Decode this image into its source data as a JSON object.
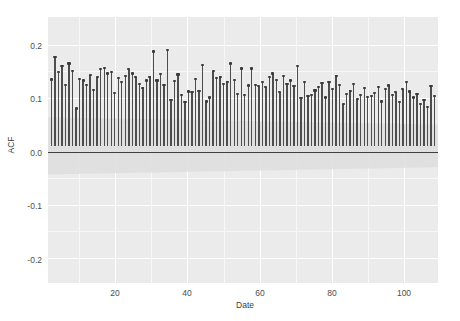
{
  "chart_data": {
    "type": "bar",
    "title": "",
    "xlabel": "Date",
    "ylabel": "ACF",
    "xlim": [
      0,
      111
    ],
    "ylim": [
      -0.25,
      0.235
    ],
    "grid": true,
    "legend": null,
    "xticks": [
      20,
      40,
      60,
      80,
      100
    ],
    "xtick_labels": [
      "20",
      "40",
      "60",
      "80",
      "100"
    ],
    "yticks": [
      -0.2,
      -0.1,
      0.0,
      0.1,
      0.2
    ],
    "ytick_labels": [
      "-0.2",
      "-0.1",
      "0.0",
      "0.1",
      "0.2"
    ],
    "zero_line": 0.0,
    "confidence_band": {
      "description": "significance band, shaded, narrows slightly with lag",
      "start_value": 0.052,
      "end_value": 0.039
    },
    "bar_color": "#4d4d4d",
    "panel_color": "#ebebeb",
    "grid_color": "#ffffff",
    "x": [
      1,
      2,
      3,
      4,
      5,
      6,
      7,
      8,
      9,
      10,
      11,
      12,
      13,
      14,
      15,
      16,
      17,
      18,
      19,
      20,
      21,
      22,
      23,
      24,
      25,
      26,
      27,
      28,
      29,
      30,
      31,
      32,
      33,
      34,
      35,
      36,
      37,
      38,
      39,
      40,
      41,
      42,
      43,
      44,
      45,
      46,
      47,
      48,
      49,
      50,
      51,
      52,
      53,
      54,
      55,
      56,
      57,
      58,
      59,
      60,
      61,
      62,
      63,
      64,
      65,
      66,
      67,
      68,
      69,
      70,
      71,
      72,
      73,
      74,
      75,
      76,
      77,
      78,
      79,
      80,
      81,
      82,
      83,
      84,
      85,
      86,
      87,
      88,
      89,
      90,
      91,
      92,
      93,
      94,
      95,
      96,
      97,
      98,
      99,
      100,
      101,
      102,
      103,
      104,
      105,
      106,
      107,
      108,
      109,
      110
    ],
    "categories": [
      "1",
      "2",
      "3",
      "4",
      "5",
      "6",
      "7",
      "8",
      "9",
      "10",
      "11",
      "12",
      "13",
      "14",
      "15",
      "16",
      "17",
      "18",
      "19",
      "20",
      "21",
      "22",
      "23",
      "24",
      "25",
      "26",
      "27",
      "28",
      "29",
      "30",
      "31",
      "32",
      "33",
      "34",
      "35",
      "36",
      "37",
      "38",
      "39",
      "40",
      "41",
      "42",
      "43",
      "44",
      "45",
      "46",
      "47",
      "48",
      "49",
      "50",
      "51",
      "52",
      "53",
      "54",
      "55",
      "56",
      "57",
      "58",
      "59",
      "60",
      "61",
      "62",
      "63",
      "64",
      "65",
      "66",
      "67",
      "68",
      "69",
      "70",
      "71",
      "72",
      "73",
      "74",
      "75",
      "76",
      "77",
      "78",
      "79",
      "80",
      "81",
      "82",
      "83",
      "84",
      "85",
      "86",
      "87",
      "88",
      "89",
      "90",
      "91",
      "92",
      "93",
      "94",
      "95",
      "96",
      "97",
      "98",
      "99",
      "100",
      "101",
      "102",
      "103",
      "104",
      "105",
      "106",
      "107",
      "108",
      "109",
      "110"
    ],
    "values": [
      0.122,
      0.163,
      0.135,
      0.146,
      0.112,
      0.151,
      0.138,
      0.069,
      0.123,
      0.12,
      0.112,
      0.13,
      0.103,
      0.126,
      0.141,
      0.143,
      0.133,
      0.136,
      0.098,
      0.125,
      0.118,
      0.129,
      0.141,
      0.133,
      0.126,
      0.114,
      0.107,
      0.12,
      0.127,
      0.173,
      0.12,
      0.132,
      0.112,
      0.175,
      0.085,
      0.119,
      0.131,
      0.093,
      0.081,
      0.1,
      0.099,
      0.123,
      0.101,
      0.148,
      0.082,
      0.089,
      0.137,
      0.124,
      0.127,
      0.114,
      0.118,
      0.151,
      0.121,
      0.095,
      0.142,
      0.094,
      0.111,
      0.142,
      0.112,
      0.11,
      0.118,
      0.108,
      0.126,
      0.133,
      0.121,
      0.099,
      0.129,
      0.114,
      0.12,
      0.11,
      0.147,
      0.088,
      0.117,
      0.092,
      0.094,
      0.102,
      0.108,
      0.116,
      0.089,
      0.118,
      0.104,
      0.129,
      0.112,
      0.077,
      0.096,
      0.101,
      0.113,
      0.086,
      0.094,
      0.106,
      0.09,
      0.092,
      0.098,
      0.108,
      0.082,
      0.104,
      0.111,
      0.093,
      0.099,
      0.081,
      0.104,
      0.118,
      0.1,
      0.089,
      0.096,
      0.078,
      0.084,
      0.072,
      0.11,
      0.092
    ],
    "series": [
      {
        "name": "ACF",
        "values": [
          0.122,
          0.163,
          0.135,
          0.146,
          0.112,
          0.151,
          0.138,
          0.069,
          0.123,
          0.12,
          0.112,
          0.13,
          0.103,
          0.126,
          0.141,
          0.143,
          0.133,
          0.136,
          0.098,
          0.125,
          0.118,
          0.129,
          0.141,
          0.133,
          0.126,
          0.114,
          0.107,
          0.12,
          0.127,
          0.173,
          0.12,
          0.132,
          0.112,
          0.175,
          0.085,
          0.119,
          0.131,
          0.093,
          0.081,
          0.1,
          0.099,
          0.123,
          0.101,
          0.148,
          0.082,
          0.089,
          0.137,
          0.124,
          0.127,
          0.114,
          0.118,
          0.151,
          0.121,
          0.095,
          0.142,
          0.094,
          0.111,
          0.142,
          0.112,
          0.11,
          0.118,
          0.108,
          0.126,
          0.133,
          0.121,
          0.099,
          0.129,
          0.114,
          0.12,
          0.11,
          0.147,
          0.088,
          0.117,
          0.092,
          0.094,
          0.102,
          0.108,
          0.116,
          0.089,
          0.118,
          0.104,
          0.129,
          0.112,
          0.077,
          0.096,
          0.101,
          0.113,
          0.086,
          0.094,
          0.106,
          0.09,
          0.092,
          0.098,
          0.108,
          0.082,
          0.104,
          0.111,
          0.093,
          0.099,
          0.081,
          0.104,
          0.118,
          0.1,
          0.089,
          0.096,
          0.078,
          0.084,
          0.072,
          0.11,
          0.092
        ]
      }
    ]
  }
}
